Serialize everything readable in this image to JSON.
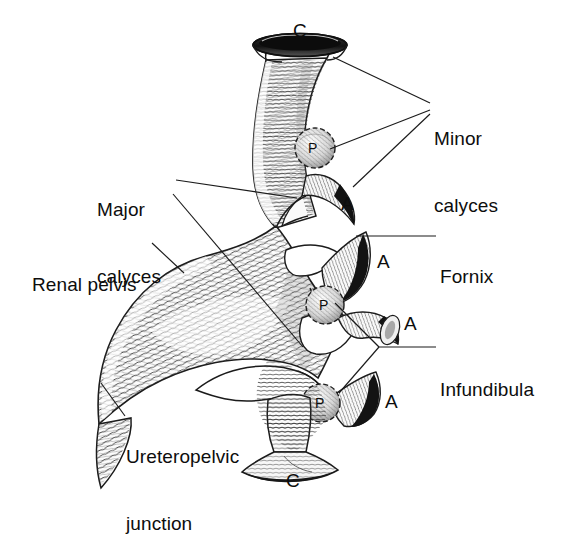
{
  "figure": {
    "style": "line-engraving medical illustration",
    "background_color": "#ffffff",
    "ink_color": "#111111"
  },
  "labels": [
    {
      "id": "minor-calyces",
      "text": "Minor\ncalyces",
      "line1": "Minor",
      "line2": "calyces",
      "x": 434,
      "y": 93,
      "align": "left"
    },
    {
      "id": "major-calyces",
      "text": "Major\ncalyces",
      "line1": "Major",
      "line2": "calyces",
      "x": 97,
      "y": 164,
      "align": "left"
    },
    {
      "id": "renal-pelvis",
      "text": "Renal pelvis",
      "line1": "Renal pelvis",
      "line2": "",
      "x": 32,
      "y": 237,
      "align": "left"
    },
    {
      "id": "fornix",
      "text": "Fornix",
      "line1": "Fornix",
      "line2": "",
      "x": 440,
      "y": 228,
      "align": "left"
    },
    {
      "id": "infundibula",
      "text": "Infundibula",
      "line1": "Infundibula",
      "line2": "",
      "x": 440,
      "y": 340,
      "align": "left"
    },
    {
      "id": "ureteropelvic-junction",
      "text": "Ureteropelvic\njunction",
      "line1": "Ureteropelvic",
      "line2": "junction",
      "x": 126,
      "y": 410,
      "align": "left"
    }
  ],
  "markers": [
    {
      "id": "calyx-top",
      "letter": "C",
      "meaning": "calyx",
      "x": 293,
      "y": 20
    },
    {
      "id": "papilla-upper",
      "letter": "P",
      "meaning": "papilla",
      "x": 308,
      "y": 142
    },
    {
      "id": "fornix-upper",
      "letter": "A",
      "meaning": "fornix",
      "x": 341,
      "y": 193
    },
    {
      "id": "fornix-mid-upper",
      "letter": "A",
      "meaning": "fornix",
      "x": 377,
      "y": 254
    },
    {
      "id": "papilla-middle",
      "letter": "P",
      "meaning": "papilla",
      "x": 318,
      "y": 299
    },
    {
      "id": "fornix-mid-lower",
      "letter": "A",
      "meaning": "fornix",
      "x": 398,
      "y": 316
    },
    {
      "id": "papilla-lower",
      "letter": "P",
      "meaning": "papilla",
      "x": 314,
      "y": 397
    },
    {
      "id": "fornix-lower",
      "letter": "A",
      "meaning": "fornix",
      "x": 381,
      "y": 393
    },
    {
      "id": "calyx-bottom",
      "letter": "C",
      "meaning": "calyx",
      "x": 286,
      "y": 468
    }
  ],
  "leader_lines": [
    {
      "id": "minor-calyces-leader-1",
      "from": [
        430,
        103
      ],
      "to": [
        331,
        58
      ]
    },
    {
      "id": "minor-calyces-leader-2",
      "from": [
        430,
        110
      ],
      "to": [
        327,
        148
      ]
    },
    {
      "id": "minor-calyces-leader-3",
      "from": [
        430,
        114
      ],
      "to": [
        352,
        185
      ]
    },
    {
      "id": "major-calyces-leader-1",
      "from": [
        175,
        180
      ],
      "to": [
        296,
        197
      ]
    },
    {
      "id": "major-calyces-leader-2",
      "from": [
        172,
        193
      ],
      "to": [
        302,
        345
      ]
    },
    {
      "id": "renal-pelvis-leader",
      "from": [
        152,
        243
      ],
      "to": [
        183,
        272
      ]
    },
    {
      "id": "fornix-leader",
      "from": [
        436,
        236
      ],
      "to": [
        355,
        236
      ]
    },
    {
      "id": "infundibula-leader",
      "from": [
        436,
        347
      ],
      "to": [
        378,
        347
      ]
    },
    {
      "id": "infundibula-fork-up",
      "from": [
        378,
        347
      ],
      "to": [
        334,
        303
      ]
    },
    {
      "id": "infundibula-fork-down",
      "from": [
        378,
        347
      ],
      "to": [
        338,
        392
      ]
    },
    {
      "id": "upj-leader",
      "from": [
        124,
        416
      ],
      "to": [
        101,
        383
      ]
    }
  ],
  "anatomy_parts": [
    {
      "id": "superior-major-calyx",
      "name": "superior major calyx / infundibulum"
    },
    {
      "id": "renal-pelvis-body",
      "name": "renal pelvis"
    },
    {
      "id": "ureter",
      "name": "ureter"
    },
    {
      "id": "minor-calyx-upper",
      "name": "upper minor calyx"
    },
    {
      "id": "minor-calyx-mid-upper",
      "name": "middle-upper minor calyx"
    },
    {
      "id": "minor-calyx-mid-lower",
      "name": "middle-lower minor calyx"
    },
    {
      "id": "minor-calyx-lower",
      "name": "lower minor calyx"
    },
    {
      "id": "inferior-calyx",
      "name": "inferior calyx"
    }
  ]
}
